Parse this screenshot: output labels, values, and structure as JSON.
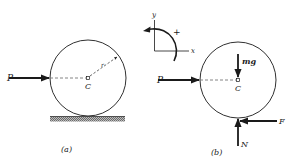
{
  "figure": {
    "panel_a": {
      "caption": "(a)",
      "force_label": "P",
      "center_label": "C",
      "radius_label": "r"
    },
    "axes": {
      "x_label": "x",
      "y_label": "y",
      "sign_label": "+"
    },
    "panel_b": {
      "caption": "(b)",
      "force_p_label": "P",
      "weight_label": "mg",
      "center_label": "C",
      "friction_label": "F",
      "normal_label": "N"
    }
  },
  "colors": {
    "ink": "#1a1a1a",
    "dashed": "#555555",
    "background": "#ffffff"
  }
}
